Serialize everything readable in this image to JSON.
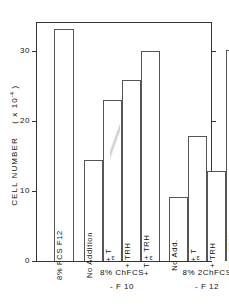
{
  "figure": {
    "background": "#ffffff",
    "ink_color": "#333333"
  },
  "chart_data": {
    "type": "bar",
    "title": "",
    "xlabel": "",
    "ylabel": "CELL NUMBER ( x 10-4 )",
    "ylabel_text": "CELL   NUMBER",
    "ylabel_unit_prefix": "( x 10",
    "ylabel_unit_exp": "-4",
    "ylabel_unit_suffix": " )",
    "ylim": [
      0,
      35
    ],
    "yticks": [
      0,
      10,
      20,
      30
    ],
    "ytick_labels": [
      "0",
      "10",
      "20",
      "30"
    ],
    "grid": false,
    "legend": "none",
    "categories": [
      "8% FCS  F12",
      "No Addition",
      "+ T3",
      "+ TRH",
      "+ T3 + TRH",
      "No Add.",
      "+ T3",
      "+ TRH",
      "+ T3 + TRH"
    ],
    "values": [
      33.1,
      14.4,
      23.0,
      25.9,
      30.0,
      9.1,
      17.9,
      12.9,
      30.1
    ],
    "groups": [
      {
        "label_line1": "",
        "label_line2": "",
        "bar_indices": [
          0
        ]
      },
      {
        "label_line1": "8% ChFCS",
        "label_line2": "- F 10",
        "bar_indices": [
          1,
          2,
          3,
          4
        ]
      },
      {
        "label_line1": "8% 2ChFCS",
        "label_line2": "- F 12",
        "bar_indices": [
          5,
          6,
          7,
          8
        ]
      }
    ]
  },
  "bars": [
    {
      "name": "bar-fcs-f12",
      "label_pre": "8% FCS  F12",
      "label_sub": "",
      "label_post": "",
      "value": 33.1,
      "x": 18,
      "w": 20
    },
    {
      "name": "bar-chfcs-noadd",
      "label_pre": "No Addition",
      "label_sub": "",
      "label_post": "",
      "value": 14.4,
      "x": 48,
      "w": 19
    },
    {
      "name": "bar-chfcs-t3",
      "label_pre": "+ T",
      "label_sub": "3",
      "label_post": "",
      "value": 23.0,
      "x": 67,
      "w": 19
    },
    {
      "name": "bar-chfcs-trh",
      "label_pre": "+ TRH",
      "label_sub": "",
      "label_post": "",
      "value": 25.9,
      "x": 86,
      "w": 19
    },
    {
      "name": "bar-chfcs-t3-trh",
      "label_pre": "+ T",
      "label_sub": "3",
      "label_post": " + TRH",
      "value": 30.0,
      "x": 105,
      "w": 19
    },
    {
      "name": "bar-2chfcs-noadd",
      "label_pre": "No Add.",
      "label_sub": "",
      "label_post": "",
      "value": 9.1,
      "x": 133,
      "w": 19
    },
    {
      "name": "bar-2chfcs-t3",
      "label_pre": "+ T",
      "label_sub": "3",
      "label_post": "",
      "value": 17.9,
      "x": 152,
      "w": 19
    },
    {
      "name": "bar-2chfcs-trh",
      "label_pre": "+ TRH",
      "label_sub": "",
      "label_post": "",
      "value": 12.9,
      "x": 171,
      "w": 19
    },
    {
      "name": "bar-2chfcs-t3-trh",
      "label_pre": "+ T",
      "label_sub": "3",
      "label_post": " + TRH",
      "value": 30.1,
      "x": 190,
      "w": 19
    }
  ],
  "group_captions": [
    {
      "name": "group-caption-chfcs",
      "line1": "8% ChFCS",
      "line2": "- F 10",
      "center_x": 86
    },
    {
      "name": "group-caption-2chfcs",
      "line1": "8% 2ChFCS",
      "line2": "- F 12",
      "center_x": 171
    }
  ]
}
